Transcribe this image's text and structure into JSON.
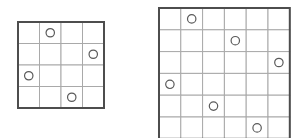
{
  "figure": {
    "background_color": "#ffffff",
    "outline_color": "#4d4d4d",
    "gridline_color": "#a9a9a9",
    "marker_stroke_color": "#5a5a5a",
    "marker_fill_color": "#ffffff"
  },
  "boards": [
    {
      "name": "left-board",
      "label": "4x4 grid",
      "rows": 4,
      "cols": 4,
      "x": 18,
      "y": 22,
      "cell_size": 21.5,
      "markers": [
        {
          "row": 1,
          "col": 2
        },
        {
          "row": 2,
          "col": 4
        },
        {
          "row": 3,
          "col": 1
        },
        {
          "row": 4,
          "col": 3
        }
      ],
      "marker_radius": 4.2
    },
    {
      "name": "right-board",
      "label": "6x6 grid",
      "rows": 6,
      "cols": 6,
      "x": 159,
      "y": 8,
      "cell_size": 21.8,
      "markers": [
        {
          "row": 1,
          "col": 2
        },
        {
          "row": 2,
          "col": 4
        },
        {
          "row": 3,
          "col": 6
        },
        {
          "row": 4,
          "col": 1
        },
        {
          "row": 5,
          "col": 3
        },
        {
          "row": 6,
          "col": 5
        }
      ],
      "marker_radius": 4.2
    }
  ]
}
